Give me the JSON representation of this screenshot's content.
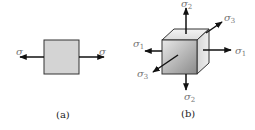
{
  "figure_a": {
    "caption": "(a)",
    "left_label": "σ",
    "right_label": "σ",
    "fill_color": "#d4d4d4"
  },
  "figure_b": {
    "caption": "(b)",
    "top_label": "σ",
    "top_sub": "2",
    "bottom_label": "σ",
    "bottom_sub": "2",
    "left_label": "σ",
    "left_sub": "1",
    "right_label": "σ",
    "right_sub": "1",
    "upper_right_label": "σ",
    "upper_right_sub": "3",
    "lower_left_label": "σ",
    "lower_left_sub": "3"
  }
}
